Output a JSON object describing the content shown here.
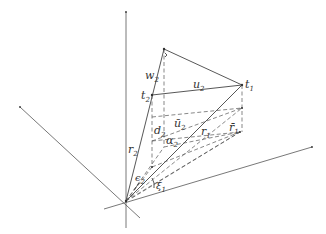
{
  "diagram": {
    "type": "3d-vector-geometry",
    "labels": {
      "t1": "t",
      "t1_sub": "1",
      "t2": "t",
      "t2_sub": "2",
      "w2": "w",
      "w2_sub": "2",
      "u2": "u",
      "u2_sub": "2",
      "u2bar": "ū",
      "u2bar_sub": "2",
      "d2": "d",
      "d2_sub": "2",
      "r1": "r",
      "r1_sub": "1",
      "r1bar": "r̄",
      "r1bar_sub": "1",
      "r2": "r",
      "r2_sub": "2",
      "alpha2": "α",
      "alpha2_sub": "2",
      "eps2": "ϵ",
      "eps2_sub": "2",
      "xi1": "ξ",
      "xi1_sub": "1"
    },
    "colors": {
      "line": "#444444",
      "dashed": "#555555",
      "background": "#ffffff"
    }
  }
}
